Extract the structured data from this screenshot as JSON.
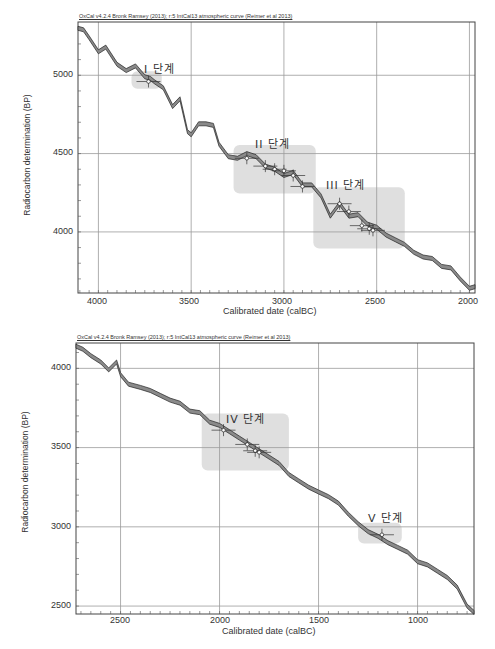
{
  "charts": [
    {
      "id": "top",
      "header": "OxCal v4.2.4 Bronk Ramsey (2013); r:5 IntCal13 atmospheric curve (Reimer et al 2013)",
      "xlabel": "Calibrated date (calBC)",
      "ylabel": "Radiocarbon determination (BP)",
      "xticks": [
        "4000",
        "3500",
        "3000",
        "2500",
        "2000"
      ],
      "yticks": [
        "5000",
        "4500",
        "4000"
      ],
      "phases": [
        {
          "label": "I 단계"
        },
        {
          "label": "II 단계"
        },
        {
          "label": "III 단계"
        }
      ]
    },
    {
      "id": "bottom",
      "header": "OxCal v4.2.4 Bronk Ramsey (2013); r:5 IntCal13 atmospheric curve (Reimer et al 2013)",
      "xlabel": "Calibrated date (calBC)",
      "ylabel": "Radiocarbon determination (BP)",
      "xticks": [
        "2500",
        "2000",
        "1500",
        "1000"
      ],
      "yticks": [
        "4000",
        "3500",
        "3000",
        "2500"
      ],
      "phases": [
        {
          "label": "IV 단계"
        },
        {
          "label": "V 단계"
        }
      ]
    }
  ],
  "chart_data": [
    {
      "type": "line",
      "title": "OxCal v4.2.4 Bronk Ramsey (2013); r:5 IntCal13 atmospheric curve (Reimer et al 2013)",
      "xlabel": "Calibrated date (calBC)",
      "ylabel": "Radiocarbon determination (BP)",
      "xlim": [
        4110,
        1970
      ],
      "ylim": [
        3610,
        5340
      ],
      "x_reversed": true,
      "grid": true,
      "series": [
        {
          "name": "IntCal13 calibration curve",
          "x": [
            4110,
            4080,
            4050,
            4000,
            3960,
            3900,
            3850,
            3800,
            3750,
            3720,
            3700,
            3650,
            3600,
            3560,
            3520,
            3500,
            3460,
            3420,
            3380,
            3350,
            3300,
            3250,
            3200,
            3150,
            3100,
            3050,
            3000,
            2950,
            2900,
            2850,
            2800,
            2750,
            2700,
            2650,
            2600,
            2550,
            2500,
            2450,
            2400,
            2350,
            2300,
            2250,
            2200,
            2150,
            2100,
            2050,
            2000,
            1970
          ],
          "y": [
            5300,
            5290,
            5240,
            5150,
            5180,
            5070,
            5030,
            5060,
            4990,
            4980,
            4960,
            4920,
            4800,
            4850,
            4640,
            4620,
            4690,
            4690,
            4680,
            4560,
            4480,
            4470,
            4500,
            4480,
            4420,
            4400,
            4360,
            4380,
            4300,
            4300,
            4230,
            4100,
            4180,
            4100,
            4110,
            4050,
            4030,
            3980,
            3950,
            3920,
            3870,
            3840,
            3830,
            3780,
            3770,
            3700,
            3640,
            3650
          ]
        }
      ],
      "phases": [
        {
          "label": "I 단계",
          "x_range": [
            3800,
            3680
          ],
          "y_range": [
            4940,
            5000
          ]
        },
        {
          "label": "II 단계",
          "x_range": [
            3250,
            2850
          ],
          "y_range": [
            4270,
            4530
          ]
        },
        {
          "label": "III 단계",
          "x_range": [
            2820,
            2370
          ],
          "y_range": [
            3920,
            4260
          ]
        }
      ],
      "samples": [
        {
          "phase": "I",
          "x": 3730,
          "y": 4960
        },
        {
          "phase": "II",
          "x": 3200,
          "y": 4470
        },
        {
          "phase": "II",
          "x": 3100,
          "y": 4420
        },
        {
          "phase": "II",
          "x": 3050,
          "y": 4400
        },
        {
          "phase": "II",
          "x": 3000,
          "y": 4390
        },
        {
          "phase": "II",
          "x": 2950,
          "y": 4360
        },
        {
          "phase": "II",
          "x": 2900,
          "y": 4290
        },
        {
          "phase": "III",
          "x": 2700,
          "y": 4180
        },
        {
          "phase": "III",
          "x": 2650,
          "y": 4130
        },
        {
          "phase": "III",
          "x": 2580,
          "y": 4040
        },
        {
          "phase": "III",
          "x": 2540,
          "y": 4020
        },
        {
          "phase": "III",
          "x": 2520,
          "y": 4010
        }
      ]
    },
    {
      "type": "line",
      "title": "OxCal v4.2.4 Bronk Ramsey (2013); r:5 IntCal13 atmospheric curve (Reimer et al 2013)",
      "xlabel": "Calibrated date (calBC)",
      "ylabel": "Radiocarbon determination (BP)",
      "xlim": [
        2725,
        715
      ],
      "ylim": [
        2450,
        4160
      ],
      "x_reversed": true,
      "grid": true,
      "series": [
        {
          "name": "IntCal13 calibration curve",
          "x": [
            2725,
            2690,
            2650,
            2600,
            2560,
            2520,
            2500,
            2460,
            2400,
            2350,
            2300,
            2250,
            2200,
            2150,
            2100,
            2050,
            2000,
            1950,
            1900,
            1850,
            1800,
            1750,
            1700,
            1650,
            1600,
            1550,
            1500,
            1450,
            1400,
            1350,
            1300,
            1250,
            1200,
            1150,
            1100,
            1050,
            1000,
            950,
            900,
            850,
            800,
            750,
            715
          ],
          "y": [
            4140,
            4120,
            4080,
            4040,
            3990,
            4040,
            3960,
            3900,
            3880,
            3860,
            3830,
            3800,
            3780,
            3730,
            3720,
            3660,
            3640,
            3600,
            3560,
            3520,
            3480,
            3440,
            3400,
            3330,
            3290,
            3250,
            3220,
            3190,
            3150,
            3080,
            3020,
            2970,
            2940,
            2900,
            2870,
            2840,
            2780,
            2760,
            2720,
            2680,
            2620,
            2500,
            2460
          ]
        }
      ],
      "phases": [
        {
          "label": "IV 단계",
          "x_range": [
            2070,
            1670
          ],
          "y_range": [
            3380,
            3690
          ]
        },
        {
          "label": "V 단계",
          "x_range": [
            1280,
            1100
          ],
          "y_range": [
            2920,
            3000
          ]
        }
      ],
      "samples": [
        {
          "phase": "IV",
          "x": 1980,
          "y": 3610
        },
        {
          "phase": "IV",
          "x": 1860,
          "y": 3520
        },
        {
          "phase": "IV",
          "x": 1820,
          "y": 3480
        },
        {
          "phase": "IV",
          "x": 1800,
          "y": 3470
        },
        {
          "phase": "V",
          "x": 1180,
          "y": 2950
        }
      ]
    }
  ]
}
